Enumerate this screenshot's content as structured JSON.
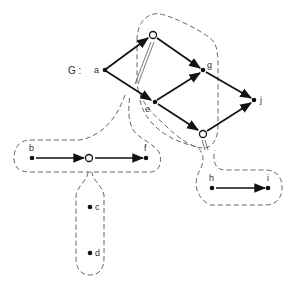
{
  "graph": {
    "name_label": "G :",
    "nodes": {
      "a": "a",
      "e": "e",
      "g": "g",
      "j": "j",
      "b": "b",
      "f": "f",
      "c": "c",
      "d": "d",
      "h": "h",
      "i": "i"
    }
  },
  "colors": {
    "edge": "#111111",
    "outline": "#555555",
    "background": "#ffffff"
  }
}
